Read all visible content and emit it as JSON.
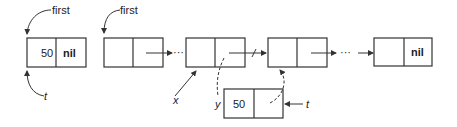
{
  "diagram": {
    "nodes": [
      {
        "id": "single",
        "data": "50",
        "next": "nil",
        "x": 27,
        "y": 38
      },
      {
        "id": "n1",
        "data": "",
        "next": "",
        "x": 104,
        "y": 38
      },
      {
        "id": "n2",
        "data": "",
        "next": "",
        "x": 186,
        "y": 38
      },
      {
        "id": "n3",
        "data": "",
        "next": "",
        "x": 268,
        "y": 38
      },
      {
        "id": "n4",
        "data": "",
        "next": "nil",
        "x": 374,
        "y": 38
      },
      {
        "id": "new",
        "data": "50",
        "next": "",
        "x": 224,
        "y": 89
      }
    ],
    "labels": {
      "first_left": "first",
      "t_left": "t",
      "first_main": "first",
      "x": "x",
      "y": "y",
      "t_right": "t",
      "ellipsis_1": "···",
      "ellipsis_2": "···"
    },
    "colors": {
      "stroke": "#333333",
      "background": "#ffffff"
    }
  }
}
